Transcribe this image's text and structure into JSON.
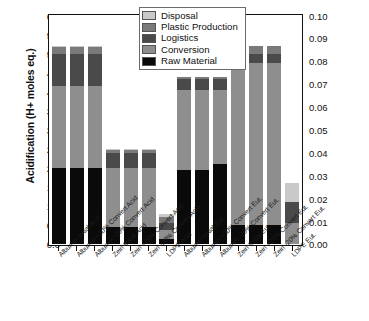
{
  "chart_data": {
    "type": "bar",
    "stacked": true,
    "title": "",
    "xlabel": "",
    "ylabel": "Acidification (H+ moles eq.)",
    "y2label": "Eutrophication (kg N eq.)",
    "ylim": [
      0.0,
      6.0
    ],
    "y2lim": [
      0.0,
      0.1
    ],
    "yticks": [
      "0.0",
      "0.5",
      "1.0",
      "1.5",
      "2.0",
      "2.5",
      "3.0",
      "3.5",
      "4.0",
      "4.5",
      "5.0",
      "5.5",
      "6.0"
    ],
    "y2ticks": [
      "0.00",
      "0.01",
      "0.02",
      "0.03",
      "0.04",
      "0.05",
      "0.06",
      "0.07",
      "0.08",
      "0.09",
      "0.10"
    ],
    "grid": false,
    "legend_position": "top-center",
    "categories": [
      "Albumin Initial Acid",
      "Albumin +20% Convert Acid",
      "Albumin -20% Convert Acid",
      "Zein Initial Acid",
      "Zein +20% Convert Acid",
      "Zein -20% Convert Acid",
      "LDPE Acid",
      "Albumin Initial Eut.",
      "Albumin +20% Convert Eut.",
      "Albumin -20% Convert Eut.",
      "Zein Initial Eut.",
      "Zein +20% Convert Eut.",
      "Zein -20% Convert Eut.",
      "LDPE Eut."
    ],
    "axis_assignment": [
      "left",
      "left",
      "left",
      "left",
      "left",
      "left",
      "left",
      "right",
      "right",
      "right",
      "right",
      "right",
      "right",
      "right"
    ],
    "series": [
      {
        "name": "Raw Material",
        "color": "#0a0a0a",
        "values": [
          2.0,
          2.0,
          2.0,
          0.45,
          0.45,
          0.45,
          0.15,
          1.95,
          1.95,
          2.1,
          0.5,
          0.5,
          0.5,
          0.0
        ]
      },
      {
        "name": "Conversion",
        "color": "#8e8e8e",
        "values": [
          2.15,
          2.15,
          2.15,
          1.55,
          1.55,
          1.55,
          0.22,
          2.1,
          2.1,
          1.95,
          4.25,
          4.25,
          4.25,
          0.55
        ]
      },
      {
        "name": "Logistics",
        "color": "#4a4a4a",
        "values": [
          0.85,
          0.85,
          0.85,
          0.4,
          0.4,
          0.4,
          0.18,
          0.3,
          0.3,
          0.3,
          0.25,
          0.25,
          0.25,
          0.55
        ]
      },
      {
        "name": "Plastic Production",
        "color": "#7a7a7a",
        "values": [
          0.18,
          0.18,
          0.18,
          0.08,
          0.08,
          0.08,
          0.18,
          0.05,
          0.05,
          0.05,
          0.2,
          0.2,
          0.2,
          0.0
        ]
      },
      {
        "name": "Disposal",
        "color": "#c9c9c9",
        "values": [
          0.02,
          0.02,
          0.02,
          0.02,
          0.02,
          0.02,
          0.07,
          0.0,
          0.0,
          0.0,
          0.0,
          0.0,
          0.0,
          0.5
        ]
      }
    ],
    "totals": [
      5.2,
      5.2,
      5.2,
      2.5,
      2.5,
      2.5,
      0.8,
      4.4,
      4.4,
      4.4,
      5.2,
      5.2,
      5.2,
      1.6
    ]
  },
  "legend": {
    "items": [
      {
        "label": "Disposal",
        "color": "#c9c9c9"
      },
      {
        "label": "Plastic Production",
        "color": "#7a7a7a"
      },
      {
        "label": "Logistics",
        "color": "#4a4a4a"
      },
      {
        "label": "Conversion",
        "color": "#8e8e8e"
      },
      {
        "label": "Raw Material",
        "color": "#0a0a0a"
      }
    ]
  }
}
